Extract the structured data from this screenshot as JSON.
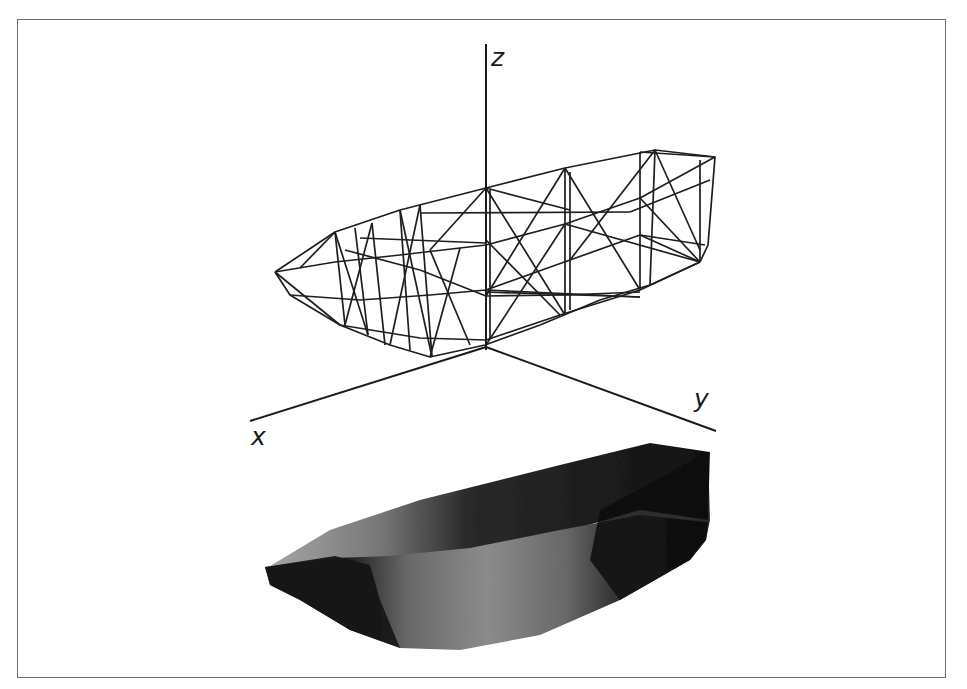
{
  "figure": {
    "axes": {
      "z_label": "z",
      "x_label": "x",
      "y_label": "y"
    },
    "colors": {
      "border": "#6e6e6e",
      "wire": "#1c1c1c",
      "solid_dark": "#141414",
      "solid_mid": "#5a5a5a",
      "solid_light": "#9a9a9a",
      "background": "#ffffff"
    }
  }
}
